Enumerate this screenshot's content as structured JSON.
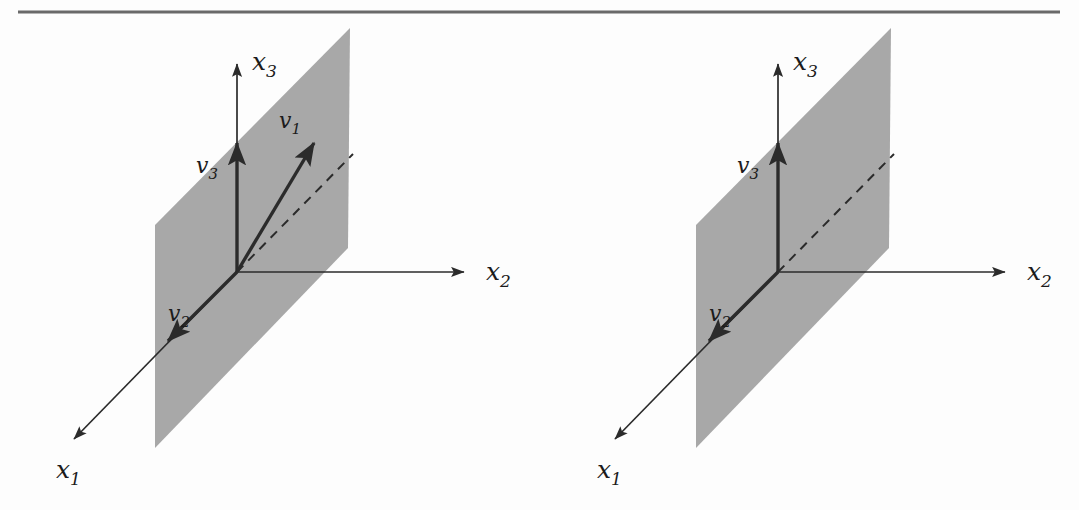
{
  "figure": {
    "type": "diagram",
    "kind": "vector-space-3d-plane",
    "background_color": "#fdfdfd",
    "ink_color": "#2b2b2b",
    "plane_fill_color": "#a8a8a8",
    "rule": {
      "label": "top-rule",
      "color": "#6a6a6a"
    }
  },
  "panels": [
    {
      "id": "left",
      "name": "left-diagram",
      "origin": {
        "x": 237,
        "y": 272
      },
      "axes": [
        {
          "name": "x1",
          "label": "x",
          "sub": "1",
          "label_x": 68,
          "label_y": 478,
          "tip_x": 70,
          "tip_y": 443
        },
        {
          "name": "x2",
          "label": "x",
          "sub": "2",
          "label_x": 486,
          "label_y": 280,
          "tip_x": 470,
          "tip_y": 272
        },
        {
          "name": "x3",
          "label": "x",
          "sub": "3",
          "label_x": 252,
          "label_y": 70,
          "tip_x": 237,
          "tip_y": 60
        }
      ],
      "plane": {
        "name": "shaded-plane",
        "points": "155,225 350,28 348,248 155,448"
      },
      "vectors": [
        {
          "name": "v1",
          "label": "v",
          "sub": "1",
          "label_x": 282,
          "label_y": 128,
          "tip_x": 318,
          "tip_y": 138
        },
        {
          "name": "v2",
          "label": "v",
          "sub": "2",
          "label_x": 172,
          "label_y": 320,
          "tip_x": 163,
          "tip_y": 345
        },
        {
          "name": "v3",
          "label": "v",
          "sub": "3",
          "label_x": 199,
          "label_y": 172,
          "tip_x": 237,
          "tip_y": 140
        }
      ],
      "dashed_line": {
        "name": "dashed-guide",
        "tip_x": 353,
        "tip_y": 154
      }
    },
    {
      "id": "right",
      "name": "right-diagram",
      "origin": {
        "x": 778,
        "y": 272
      },
      "axes": [
        {
          "name": "x1",
          "label": "x",
          "sub": "1",
          "label_x": 609,
          "label_y": 478,
          "tip_x": 611,
          "tip_y": 443
        },
        {
          "name": "x2",
          "label": "x",
          "sub": "2",
          "label_x": 1027,
          "label_y": 280,
          "tip_x": 1011,
          "tip_y": 272
        },
        {
          "name": "x3",
          "label": "x",
          "sub": "3",
          "label_x": 793,
          "label_y": 70,
          "tip_x": 778,
          "tip_y": 60
        }
      ],
      "plane": {
        "name": "shaded-plane",
        "points": "696,225 891,28 889,248 696,448"
      },
      "vectors": [
        {
          "name": "v2",
          "label": "v",
          "sub": "2",
          "label_x": 713,
          "label_y": 320,
          "tip_x": 704,
          "tip_y": 345
        },
        {
          "name": "v3",
          "label": "v",
          "sub": "3",
          "label_x": 740,
          "label_y": 172,
          "tip_x": 778,
          "tip_y": 140
        }
      ],
      "dashed_line": {
        "name": "dashed-guide",
        "tip_x": 894,
        "tip_y": 154
      }
    }
  ]
}
